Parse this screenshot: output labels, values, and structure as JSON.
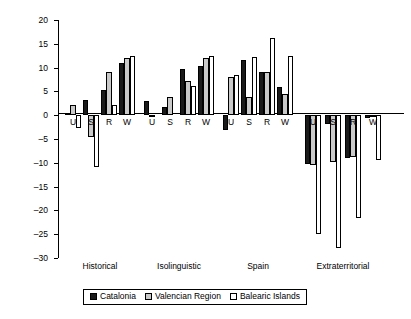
{
  "chart_data": {
    "type": "bar",
    "title": "",
    "subtitle": "",
    "xlabel": "",
    "ylabel": "Percentage change",
    "ylim": [
      -30,
      20
    ],
    "yticks": [
      20,
      15,
      10,
      5,
      0,
      -5,
      -10,
      -15,
      -20,
      -25,
      -30
    ],
    "ytick_labels": [
      "20",
      "15",
      "10",
      "5",
      "0",
      "–5",
      "–10",
      "–15",
      "–20",
      "–25",
      "–30"
    ],
    "grid": false,
    "legend_position": "bottom",
    "group_labels": [
      "Historical",
      "Isolinguistic",
      "Spain",
      "Extraterritorial"
    ],
    "categories": [
      "U",
      "S",
      "R",
      "W"
    ],
    "series_names": [
      "Catalonia",
      "Valencian Region",
      "Balearic Islands"
    ],
    "groups": [
      {
        "name": "Historical",
        "categories": [
          "U",
          "S",
          "R",
          "W"
        ],
        "series": [
          {
            "name": "Catalonia",
            "values": [
              0.4,
              3.1,
              5.3,
              11.0
            ]
          },
          {
            "name": "Valencian Region",
            "values": [
              2.2,
              -4.5,
              9.1,
              12.1
            ]
          },
          {
            "name": "Balearic Islands",
            "values": [
              -2.6,
              -10.9,
              2.2,
              12.5
            ]
          }
        ]
      },
      {
        "name": "Isolinguistic",
        "categories": [
          "U",
          "S",
          "R",
          "W"
        ],
        "series": [
          {
            "name": "Catalonia",
            "values": [
              2.9,
              1.8,
              9.7,
              10.3
            ]
          },
          {
            "name": "Valencian Region",
            "values": [
              -0.4,
              3.9,
              7.1,
              12.1
            ]
          },
          {
            "name": "Balearic Islands",
            "values": [
              0.0,
              0.0,
              6.1,
              12.4
            ]
          }
        ]
      },
      {
        "name": "Spain",
        "categories": [
          "U",
          "S",
          "R",
          "W"
        ],
        "series": [
          {
            "name": "Catalonia",
            "values": [
              -3.2,
              11.7,
              9.0,
              5.9
            ]
          },
          {
            "name": "Valencian Region",
            "values": [
              8.0,
              3.8,
              9.0,
              4.4
            ]
          },
          {
            "name": "Balearic Islands",
            "values": [
              8.5,
              12.2,
              16.3,
              12.4
            ]
          }
        ]
      },
      {
        "name": "Extraterritorial",
        "categories": [
          "U",
          "S",
          "R",
          "W"
        ],
        "series": [
          {
            "name": "Catalonia",
            "values": [
              -10.2,
              -1.9,
              -9.0,
              -0.5
            ]
          },
          {
            "name": "Valencian Region",
            "values": [
              -10.4,
              -9.8,
              -8.8,
              -0.4
            ]
          },
          {
            "name": "Balearic Islands",
            "values": [
              -24.9,
              -27.9,
              -21.6,
              -9.5
            ]
          }
        ]
      }
    ],
    "colors": {
      "Catalonia": "#1a1a1a",
      "Valencian Region": "#c9c9c9",
      "Balearic Islands": "#ffffff",
      "axis": "#000000"
    }
  },
  "legend": {
    "items": [
      {
        "label": "Catalonia",
        "key": "cat"
      },
      {
        "label": "Valencian Region",
        "key": "val"
      },
      {
        "label": "Balearic Islands",
        "key": "bal"
      }
    ]
  }
}
